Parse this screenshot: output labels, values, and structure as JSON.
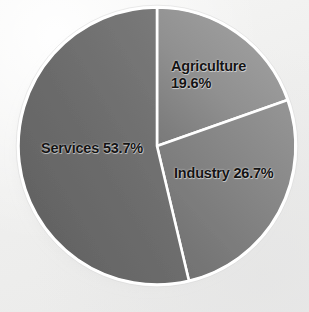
{
  "chart_data": {
    "type": "pie",
    "title": "",
    "subtitle": "",
    "xlabel": "",
    "ylabel": "",
    "grid": false,
    "legend_position": "none",
    "labels_on_slices": true,
    "units": "percent",
    "total": 100.0,
    "categories": [
      "Agriculture",
      "Industry",
      "Services"
    ],
    "values": [
      19.6,
      26.7,
      53.7
    ],
    "slices": [
      {
        "name": "Agriculture",
        "value": 19.6,
        "value_text": "19.6%",
        "label_text": "Agriculture\n19.6%",
        "color": "#8e8e8e",
        "start_angle_deg": 0.0,
        "end_angle_deg": 70.56
      },
      {
        "name": "Industry",
        "value": 26.7,
        "value_text": "26.7%",
        "label_text": "Industry 26.7%",
        "color": "#7f7f7f",
        "start_angle_deg": 70.56,
        "end_angle_deg": 166.68
      },
      {
        "name": "Services",
        "value": 53.7,
        "value_text": "53.7%",
        "label_text": "Services 53.7%",
        "color": "#6c6c6c",
        "start_angle_deg": 166.68,
        "end_angle_deg": 360.0
      }
    ]
  },
  "labels": {
    "agriculture": "Agriculture\n19.6%",
    "industry": "Industry 26.7%",
    "services": "Services 53.7%"
  },
  "colors": {
    "background": "#f2f2f1",
    "slice_border": "#ffffff",
    "label_text": "#141414",
    "agriculture": "#8e8e8e",
    "industry": "#7f7f7f",
    "services": "#6c6c6c",
    "shadow": "#bdbdbd"
  },
  "geometry": {
    "center_x": 157,
    "center_y": 146,
    "radius": 140,
    "border_width": 2.6
  }
}
